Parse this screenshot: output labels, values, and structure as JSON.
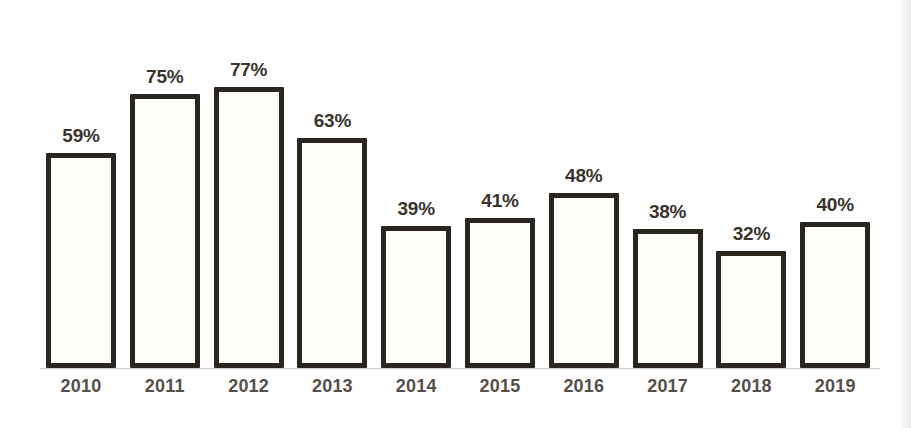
{
  "chart_data": {
    "type": "bar",
    "title": "",
    "subtitle": "",
    "xlabel": "",
    "ylabel": "",
    "ylim": [
      0,
      85
    ],
    "grid": false,
    "legend": false,
    "legend_position": "none",
    "value_label_suffix": "%",
    "categories": [
      "2010",
      "2011",
      "2012",
      "2013",
      "2014",
      "2015",
      "2016",
      "2017",
      "2018",
      "2019"
    ],
    "values": [
      59,
      75,
      77,
      63,
      39,
      41,
      48,
      38,
      32,
      40
    ],
    "value_labels": [
      "59%",
      "75%",
      "77%",
      "63%",
      "39%",
      "41%",
      "48%",
      "38%",
      "32%",
      "40%"
    ],
    "colors": {
      "bar_fill": "#fdfdfa",
      "bar_border": "#2b2520",
      "value_label": "#3a342e",
      "category_label": "#55504a",
      "background": "#ffffff",
      "baseline": "#cfcac2"
    }
  }
}
